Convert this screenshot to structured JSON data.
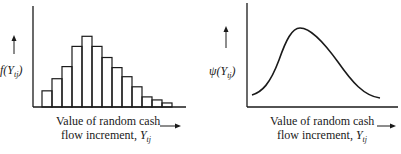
{
  "chart_data": [
    {
      "type": "bar",
      "title": "",
      "ylabel": "f(Y_tj)",
      "xlabel": "Value of random cash flow increment, Y_tj",
      "description": "Histogram (discrete probability distribution) of random cash flow increment, right-skewed",
      "categories": [
        "1",
        "2",
        "3",
        "4",
        "5",
        "6",
        "7",
        "8",
        "9",
        "10",
        "11",
        "12",
        "13"
      ],
      "values": [
        16,
        28,
        40,
        60,
        70,
        60,
        49,
        39,
        30,
        20,
        10,
        7,
        4
      ],
      "ylim": [
        0,
        100
      ],
      "grid": false,
      "legend": "none"
    },
    {
      "type": "line",
      "title": "",
      "ylabel": "ψ(Y_tj)",
      "xlabel": "Value of random cash flow increment, Y_tj",
      "description": "Continuous right-skewed density curve",
      "x": [
        0,
        10,
        20,
        30,
        40,
        50,
        60,
        70,
        80,
        90,
        100
      ],
      "values": [
        11,
        22,
        55,
        78,
        74,
        62,
        48,
        34,
        22,
        13,
        9
      ],
      "ylim": [
        0,
        100
      ],
      "grid": false,
      "legend": "none"
    }
  ],
  "left": {
    "ylabel_main": "f(Y",
    "ylabel_sub": "tj",
    "ylabel_close": ")",
    "xlabel_line1": "Value of random cash",
    "xlabel_line2": "flow increment, ",
    "xlabel_var": "Y",
    "xlabel_sub": "tj"
  },
  "right": {
    "ylabel_main": "ψ(Y",
    "ylabel_sub": "tj",
    "ylabel_close": ")",
    "xlabel_line1": "Value of random cash",
    "xlabel_line2": "flow increment, ",
    "xlabel_var": "Y",
    "xlabel_sub": "tj"
  }
}
